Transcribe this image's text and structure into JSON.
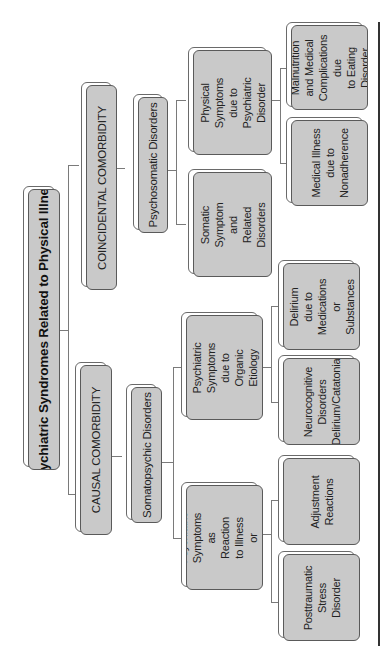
{
  "diagram": {
    "title": "Psychiatric Syndromes Related to Physical Illness",
    "orientation": "rotated -90deg (reads bottom-to-top)",
    "branches": [
      {
        "label": "COINCIDENTAL COMORBIDITY",
        "children": [
          {
            "label": "Psychosomatic Disorders",
            "children": [
              {
                "label": "Physical Symptoms\ndue to Psychiatric\nDisorder",
                "children": [
                  {
                    "label": "Malnutrition\nand Medical\nComplications due\nto Eating Disorder"
                  },
                  {
                    "label": "Medical Illness\ndue to\nNonadherence"
                  }
                ]
              },
              {
                "label": "Somatic Symptom\nand\nRelated Disorders",
                "children": []
              }
            ]
          }
        ]
      },
      {
        "label": "CAUSAL COMORBIDITY",
        "children": [
          {
            "label": "Somatopsychic Disorders",
            "children": [
              {
                "label": "Psychiatric\nSymptoms due to\nOrganic Etiology",
                "children": [
                  {
                    "label": "Delirium due to\nMedications or\nSubstances"
                  },
                  {
                    "label": "Neurocognitive\nDisorders\nDelirium/Catatonia"
                  }
                ]
              },
              {
                "label": "Psychiatric\nSymptoms as\nReaction to Illness\nor Treatment",
                "children": [
                  {
                    "label": "Adjustment\nReactions"
                  },
                  {
                    "label": "Posttraumatic\nStress\nDisorder"
                  }
                ]
              }
            ]
          }
        ]
      }
    ]
  },
  "colors": {
    "box_fill": "#c9c9c9",
    "box_border": "#5a5a5a",
    "connector": "#7a7a7a",
    "background": "#ffffff"
  }
}
